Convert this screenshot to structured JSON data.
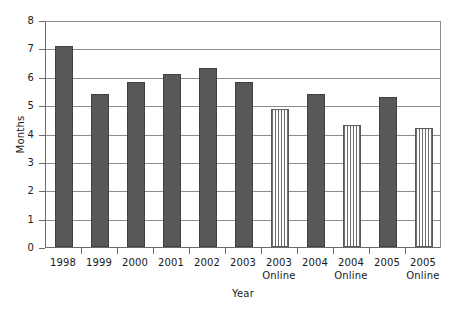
{
  "chart_data": {
    "type": "bar",
    "title": "",
    "xlabel": "Year",
    "ylabel": "Months",
    "ylim": [
      0,
      8
    ],
    "ytick_labels": [
      "8",
      "7",
      "6",
      "5",
      "4",
      "3",
      "2",
      "1",
      "0"
    ],
    "ytick_values": [
      8,
      7,
      6,
      5,
      4,
      3,
      2,
      1,
      0
    ],
    "grid": "horizontal",
    "legend": "none",
    "categories": [
      "1998",
      "1999",
      "2000",
      "2001",
      "2002",
      "2003",
      "2003 Online",
      "2004",
      "2004 Online",
      "2005",
      "2005 Online"
    ],
    "values": [
      7.1,
      5.4,
      5.8,
      6.1,
      6.3,
      5.8,
      4.85,
      5.4,
      4.3,
      5.3,
      4.2
    ],
    "bar_styles": [
      "solid",
      "solid",
      "solid",
      "solid",
      "solid",
      "solid",
      "striped",
      "solid",
      "striped",
      "solid",
      "striped"
    ],
    "series": [
      {
        "name": "Months",
        "values": [
          7.1,
          5.4,
          5.8,
          6.1,
          6.3,
          5.8,
          4.85,
          5.4,
          4.3,
          5.3,
          4.2
        ]
      }
    ],
    "colors": {
      "solid_bar": "#585858",
      "striped_bar_stripe": "#6e6e6e",
      "striped_bar_background": "#fdfdfd",
      "gridline": "#8d8d8d",
      "axis": "#6b6b6b",
      "plot_background": "#ffffff",
      "text": "#1a1a1a"
    },
    "x_labels": [
      {
        "line1": "1998",
        "line2": ""
      },
      {
        "line1": "1999",
        "line2": ""
      },
      {
        "line1": "2000",
        "line2": ""
      },
      {
        "line1": "2001",
        "line2": ""
      },
      {
        "line1": "2002",
        "line2": ""
      },
      {
        "line1": "2003",
        "line2": ""
      },
      {
        "line1": "2003",
        "line2": "Online"
      },
      {
        "line1": "2004",
        "line2": ""
      },
      {
        "line1": "2004",
        "line2": "Online"
      },
      {
        "line1": "2005",
        "line2": ""
      },
      {
        "line1": "2005",
        "line2": "Online"
      }
    ]
  }
}
